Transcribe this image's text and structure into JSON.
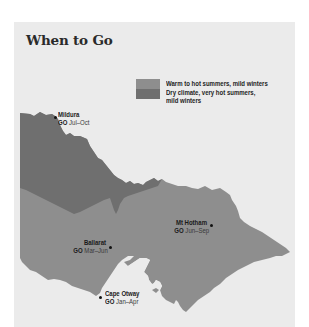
{
  "title": "When to Go",
  "legend": {
    "items": [
      {
        "label": "Warm to hot summers, mild winters",
        "color": "#8e8e8e"
      },
      {
        "label_line1": "Dry climate, very hot summers,",
        "label_line2": "mild winters",
        "color": "#6f6f6f"
      }
    ]
  },
  "colors": {
    "background": "#ffffff",
    "panel": "#ebebeb",
    "warm_region": "#8e8e8e",
    "dry_region": "#6f6f6f",
    "water": "#ebebeb"
  },
  "places": [
    {
      "name": "Mildura",
      "go_label": "GO",
      "months": "Jul–Oct"
    },
    {
      "name": "Mt Hotham",
      "go_label": "GO",
      "months": "Jun–Sep"
    },
    {
      "name": "Ballarat",
      "go_label": "GO",
      "months": "Mar–Jun"
    },
    {
      "name": "Cape Otway",
      "go_label": "GO",
      "months": "Jan–Apr"
    }
  ]
}
